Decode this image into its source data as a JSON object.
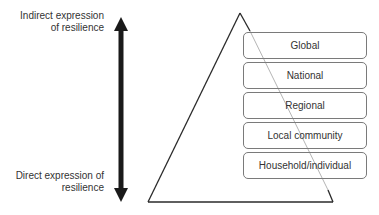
{
  "diagram": {
    "type": "pyramid",
    "axis": {
      "top_label": "Indirect expression of resilience",
      "top_label_lines": [
        "Indirect expression",
        "of resilience"
      ],
      "bottom_label": "Direct expression of resilience",
      "bottom_label_lines": [
        "Direct expression of",
        "resilience"
      ],
      "arrow": "double-headed vertical"
    },
    "levels": [
      {
        "label": "Global"
      },
      {
        "label": "National"
      },
      {
        "label": "Regional"
      },
      {
        "label": "Local community"
      },
      {
        "label": "Household/individual"
      }
    ],
    "colors": {
      "arrow": "#1a1a1a",
      "triangle_stroke": "#2a2a2a",
      "box_border": "#7a7a7a",
      "text": "#333333"
    }
  }
}
